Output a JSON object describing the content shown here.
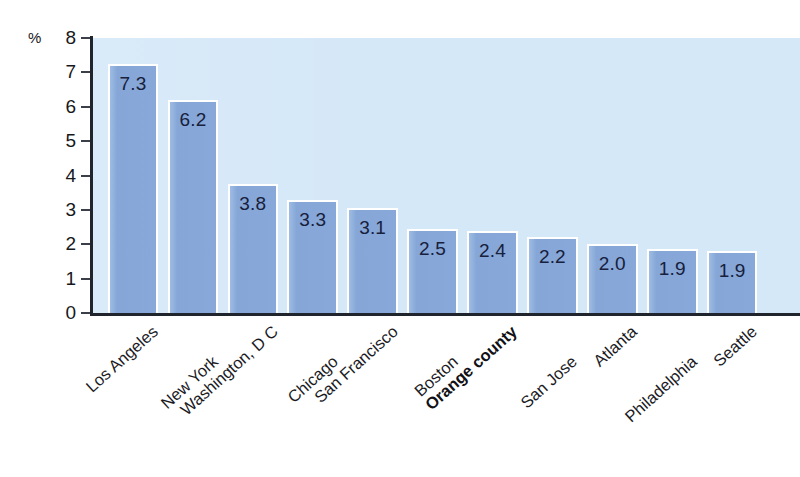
{
  "chart_data": {
    "type": "bar",
    "title": "",
    "subtitle": "",
    "xlabel": "",
    "ylabel": "",
    "unit_label": "%",
    "ylim": [
      0,
      8
    ],
    "ytick_step": 1,
    "yticks": [
      "8",
      "7",
      "6",
      "5",
      "4",
      "3",
      "2",
      "1",
      "0"
    ],
    "grid": false,
    "legend": false,
    "legend_position": "none",
    "highlight_category": "Orange county",
    "categories": [
      "Los Angeles",
      "New York",
      "Washington, D C",
      "Chicago",
      "San Francisco",
      "Boston",
      "Orange county",
      "San Jose",
      "Atlanta",
      "Philadelphia",
      "Seattle"
    ],
    "values": [
      7.3,
      6.2,
      3.8,
      3.3,
      3.1,
      2.5,
      2.4,
      2.2,
      2.0,
      1.9,
      1.9
    ],
    "value_labels": [
      "7.3",
      "6.2",
      "3.8",
      "3.3",
      "3.1",
      "2.5",
      "2.4",
      "2.2",
      "2.0",
      "1.9",
      "1.9"
    ],
    "bar_heights_drawn": [
      7.25,
      6.2,
      3.75,
      3.3,
      3.05,
      2.45,
      2.4,
      2.2,
      2.0,
      1.85,
      1.8
    ]
  },
  "style": {
    "plot_background": "#d5e8f8",
    "bar_color": "#88a9d9",
    "bar_outline": "#ffffff",
    "axis_color": "#20242c",
    "value_label_color": "#17203c",
    "category_label_color": "#1b1b1f",
    "page_background": "#ffffff"
  }
}
